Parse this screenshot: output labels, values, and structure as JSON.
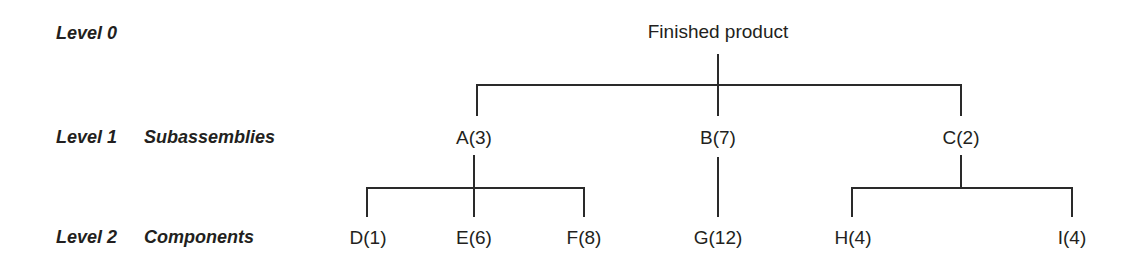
{
  "diagram": {
    "line_color": "#2a2a2a",
    "text_color": "#231f20",
    "background": "#ffffff"
  },
  "levels": [
    {
      "name": "Level 0",
      "description": ""
    },
    {
      "name": "Level 1",
      "description": "Subassemblies"
    },
    {
      "name": "Level 2",
      "description": "Components"
    }
  ],
  "nodes": {
    "root": {
      "label": "Finished product",
      "level": 0
    },
    "level1": [
      {
        "label": "A(3)",
        "level": 1
      },
      {
        "label": "B(7)",
        "level": 1
      },
      {
        "label": "C(2)",
        "level": 1
      }
    ],
    "level2": [
      {
        "label": "D(1)",
        "level": 2,
        "parent": "A(3)"
      },
      {
        "label": "E(6)",
        "level": 2,
        "parent": "A(3)"
      },
      {
        "label": "F(8)",
        "level": 2,
        "parent": "A(3)"
      },
      {
        "label": "G(12)",
        "level": 2,
        "parent": "B(7)"
      },
      {
        "label": "H(4)",
        "level": 2,
        "parent": "C(2)"
      },
      {
        "label": "I(4)",
        "level": 2,
        "parent": "C(2)"
      }
    ]
  }
}
